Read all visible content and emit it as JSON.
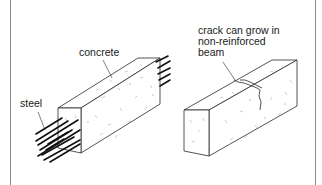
{
  "diagram": {
    "type": "illustration",
    "panels": [
      {
        "id": "reinforced-beam",
        "labels": {
          "concrete": "concrete",
          "steel": "steel"
        }
      },
      {
        "id": "non-reinforced-beam",
        "labels": {
          "crack_line1": "crack can grow in",
          "crack_line2": "non-reinforced",
          "crack_line3": "beam"
        }
      }
    ],
    "colors": {
      "line": "#2a2a2a",
      "steel": "#111111",
      "frame": "#8a8a8a",
      "background": "#ffffff",
      "speckle": "#9a9a9a"
    }
  }
}
